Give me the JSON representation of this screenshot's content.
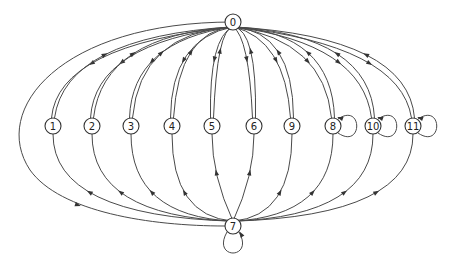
{
  "diagram": {
    "type": "directed-graph",
    "hub_top": {
      "id": "0",
      "label": "0",
      "x": 233,
      "y": 22
    },
    "hub_bottom": {
      "id": "7",
      "label": "7",
      "x": 233,
      "y": 226,
      "self_loop": "below"
    },
    "middle_nodes": [
      {
        "id": "1",
        "label": "1",
        "x": 53,
        "y": 126,
        "self_loop": false
      },
      {
        "id": "2",
        "label": "2",
        "x": 92,
        "y": 126,
        "self_loop": false
      },
      {
        "id": "3",
        "label": "3",
        "x": 131,
        "y": 126,
        "self_loop": false
      },
      {
        "id": "4",
        "label": "4",
        "x": 172,
        "y": 126,
        "self_loop": false
      },
      {
        "id": "5",
        "label": "5",
        "x": 212,
        "y": 126,
        "self_loop": false
      },
      {
        "id": "6",
        "label": "6",
        "x": 254,
        "y": 126,
        "self_loop": false
      },
      {
        "id": "9",
        "label": "9",
        "x": 292,
        "y": 126,
        "self_loop": false
      },
      {
        "id": "8",
        "label": "8",
        "x": 333,
        "y": 126,
        "self_loop": true
      },
      {
        "id": "10",
        "label": "10",
        "x": 373,
        "y": 126,
        "self_loop": true
      },
      {
        "id": "11",
        "label": "11",
        "x": 413,
        "y": 126,
        "self_loop": true
      }
    ],
    "edges_description": {
      "top_hub": "Bidirectional edges between node 0 and every middle node (pair of curved arcs)",
      "bottom_hub": "Edges from node 7 to every middle node (arrows pointing upward toward the node)",
      "outer_arc": "Edge from 0 to 7 via the far-left outer arc",
      "self_loops": [
        "7",
        "8",
        "10",
        "11"
      ]
    },
    "colors": {
      "stroke": "#4a4a4a",
      "node_fill": "#ffffff",
      "text": "#222222"
    }
  }
}
